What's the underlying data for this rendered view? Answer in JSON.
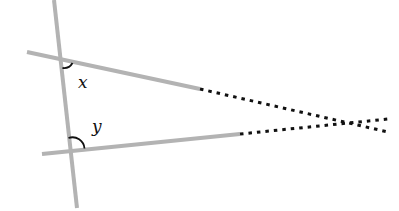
{
  "diagram": {
    "type": "geometry-transversal",
    "colors": {
      "line": "#b3b3b3",
      "dotted": "#111111",
      "arc": "#111111",
      "label": "#111111",
      "background": "#ffffff"
    },
    "transversal": {
      "x1": 54,
      "y1": 0,
      "x2": 77,
      "y2": 208
    },
    "top_line": {
      "solid": {
        "x1": 27,
        "y1": 52,
        "x2": 200,
        "y2": 89
      },
      "dotted": {
        "x1": 200,
        "y1": 89,
        "x2": 388,
        "y2": 132
      }
    },
    "bottom_line": {
      "solid": {
        "x1": 42,
        "y1": 154,
        "x2": 240,
        "y2": 134
      },
      "dotted": {
        "x1": 240,
        "y1": 134,
        "x2": 388,
        "y2": 119
      }
    },
    "angles": [
      {
        "name": "x",
        "label": "x",
        "label_x": 78,
        "label_y": 88
      },
      {
        "name": "y",
        "label": "y",
        "label_x": 92,
        "label_y": 132
      }
    ]
  }
}
